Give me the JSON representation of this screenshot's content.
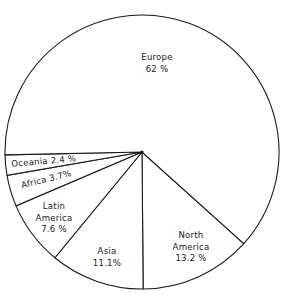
{
  "chart_data": {
    "type": "pie",
    "title": "",
    "center": [
      142,
      152
    ],
    "radius": 137,
    "start_angle_deg": 42,
    "direction": "clockwise",
    "slices": [
      {
        "name": "North America",
        "label_lines": [
          "North",
          "America",
          "13.2 %"
        ],
        "value": 13.2,
        "label_pos": [
          191,
          238
        ]
      },
      {
        "name": "Asia",
        "label_lines": [
          "Asia",
          "11.1%"
        ],
        "value": 11.1,
        "label_pos": [
          107,
          254
        ]
      },
      {
        "name": "Latin America",
        "label_lines": [
          "Latin",
          "America",
          "7.6 %"
        ],
        "value": 7.6,
        "label_pos": [
          54,
          209
        ]
      },
      {
        "name": "Africa",
        "label_lines": [
          "Africa  3.7%"
        ],
        "value": 3.7,
        "label_pos": [
          47,
          182
        ],
        "rotate": -14
      },
      {
        "name": "Oceania",
        "label_lines": [
          "Oceania  2.4 %"
        ],
        "value": 2.4,
        "label_pos": [
          44,
          164
        ],
        "rotate": -5
      },
      {
        "name": "Europe",
        "label_lines": [
          "Europe",
          "62 %"
        ],
        "value": 62,
        "label_pos": [
          157,
          60
        ]
      }
    ],
    "labels": [
      "Europe",
      "North America",
      "Asia",
      "Latin America",
      "Africa",
      "Oceania"
    ],
    "values": [
      62,
      13.2,
      11.1,
      7.6,
      3.7,
      2.4
    ],
    "legend": "none (inline labels)"
  }
}
